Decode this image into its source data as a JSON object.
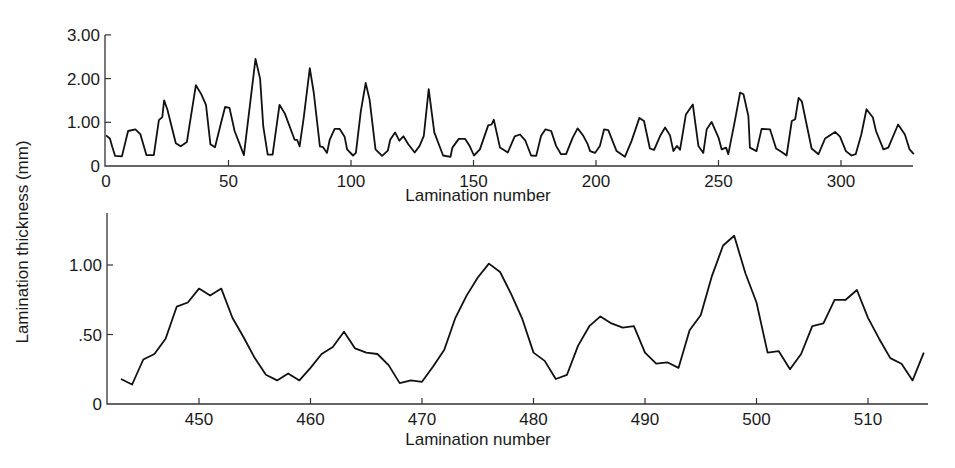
{
  "chart_data": [
    {
      "type": "line",
      "title": "",
      "xlabel": "Lamination number",
      "ylabel": "Lamination thickness (mm)",
      "xlim": [
        0,
        332
      ],
      "ylim": [
        0,
        3.0
      ],
      "grid": false,
      "legend": null,
      "x_ticks": [
        0,
        50,
        100,
        150,
        200,
        250,
        300
      ],
      "x_tick_labels": [
        "0",
        "50",
        "100",
        "150",
        "200",
        "250",
        "300"
      ],
      "y_ticks": [
        0,
        1.0,
        2.0,
        3.0
      ],
      "y_tick_labels": [
        "0",
        "1.00",
        "2.00",
        "3.00"
      ],
      "series": [
        {
          "name": "thickness",
          "points": [
            [
              0,
              0.7
            ],
            [
              1.6,
              0.63
            ],
            [
              2.5,
              0.45
            ],
            [
              3.7,
              0.23
            ],
            [
              6.5,
              0.22
            ],
            [
              9,
              0.8
            ],
            [
              12,
              0.84
            ],
            [
              14,
              0.73
            ],
            [
              16.5,
              0.25
            ],
            [
              19.5,
              0.25
            ],
            [
              21.6,
              1.05
            ],
            [
              23,
              1.12
            ],
            [
              23.7,
              1.5
            ],
            [
              25,
              1.3
            ],
            [
              28.5,
              0.52
            ],
            [
              30.5,
              0.45
            ],
            [
              33,
              0.55
            ],
            [
              34,
              0.9
            ],
            [
              36.7,
              1.85
            ],
            [
              38.8,
              1.65
            ],
            [
              40.8,
              1.4
            ],
            [
              42.6,
              0.5
            ],
            [
              44.5,
              0.43
            ],
            [
              47,
              1.0
            ],
            [
              48.6,
              1.35
            ],
            [
              50.4,
              1.33
            ],
            [
              52.5,
              0.8
            ],
            [
              56.3,
              0.25
            ],
            [
              61,
              2.45
            ],
            [
              62.9,
              2.0
            ],
            [
              64.2,
              0.9
            ],
            [
              66,
              0.26
            ],
            [
              68,
              0.26
            ],
            [
              70.8,
              1.4
            ],
            [
              73,
              1.2
            ],
            [
              77,
              0.6
            ],
            [
              78,
              0.6
            ],
            [
              79,
              0.45
            ],
            [
              80.7,
              1.1
            ],
            [
              83.2,
              2.24
            ],
            [
              84.8,
              1.67
            ],
            [
              87.3,
              0.45
            ],
            [
              88.6,
              0.43
            ],
            [
              90.2,
              0.3
            ],
            [
              91.3,
              0.6
            ],
            [
              93.3,
              0.85
            ],
            [
              95.4,
              0.85
            ],
            [
              97.4,
              0.67
            ],
            [
              98.4,
              0.38
            ],
            [
              100.8,
              0.24
            ],
            [
              102,
              0.3
            ],
            [
              104,
              1.25
            ],
            [
              106,
              1.9
            ],
            [
              107.6,
              1.52
            ],
            [
              110,
              0.38
            ],
            [
              112.7,
              0.23
            ],
            [
              115,
              0.35
            ],
            [
              116,
              0.6
            ],
            [
              118,
              0.77
            ],
            [
              119.7,
              0.58
            ],
            [
              121.4,
              0.68
            ],
            [
              123.4,
              0.5
            ],
            [
              126,
              0.31
            ],
            [
              128,
              0.46
            ],
            [
              129.7,
              0.69
            ],
            [
              131.7,
              1.76
            ],
            [
              134,
              0.77
            ],
            [
              137.6,
              0.24
            ],
            [
              140.6,
              0.21
            ],
            [
              141.4,
              0.42
            ],
            [
              144,
              0.62
            ],
            [
              146.6,
              0.62
            ],
            [
              148.5,
              0.45
            ],
            [
              150.2,
              0.24
            ],
            [
              152.6,
              0.38
            ],
            [
              156,
              0.93
            ],
            [
              157.4,
              0.95
            ],
            [
              158.3,
              1.06
            ],
            [
              160.8,
              0.42
            ],
            [
              164,
              0.31
            ],
            [
              166.8,
              0.68
            ],
            [
              169,
              0.72
            ],
            [
              171.2,
              0.58
            ],
            [
              173.5,
              0.24
            ],
            [
              175.6,
              0.23
            ],
            [
              177.6,
              0.69
            ],
            [
              179.4,
              0.84
            ],
            [
              181.7,
              0.8
            ],
            [
              183.7,
              0.46
            ],
            [
              185.7,
              0.27
            ],
            [
              187.8,
              0.27
            ],
            [
              190.5,
              0.65
            ],
            [
              192.5,
              0.86
            ],
            [
              194.8,
              0.69
            ],
            [
              196.6,
              0.5
            ],
            [
              197.6,
              0.34
            ],
            [
              199.6,
              0.3
            ],
            [
              201.6,
              0.46
            ],
            [
              203.3,
              0.84
            ],
            [
              205,
              0.82
            ],
            [
              208.4,
              0.34
            ],
            [
              211.8,
              0.21
            ],
            [
              214.5,
              0.57
            ],
            [
              217.7,
              1.1
            ],
            [
              219.6,
              1.03
            ],
            [
              222,
              0.4
            ],
            [
              223.7,
              0.37
            ],
            [
              226.2,
              0.69
            ],
            [
              228.2,
              0.88
            ],
            [
              230.2,
              0.7
            ],
            [
              231.6,
              0.34
            ],
            [
              233,
              0.46
            ],
            [
              234.3,
              0.37
            ],
            [
              236.7,
              1.18
            ],
            [
              239.5,
              1.41
            ],
            [
              241.8,
              0.46
            ],
            [
              243.8,
              0.3
            ],
            [
              245.2,
              0.84
            ],
            [
              247.2,
              1.01
            ],
            [
              250,
              0.65
            ],
            [
              251.3,
              0.38
            ],
            [
              253.1,
              0.42
            ],
            [
              254,
              0.27
            ],
            [
              256.8,
              1.07
            ],
            [
              258.8,
              1.68
            ],
            [
              260.2,
              1.64
            ],
            [
              262.2,
              1.14
            ],
            [
              262.8,
              0.42
            ],
            [
              265.5,
              0.34
            ],
            [
              267.6,
              0.85
            ],
            [
              271,
              0.84
            ],
            [
              273.5,
              0.4
            ],
            [
              275.8,
              0.32
            ],
            [
              277.8,
              0.24
            ],
            [
              279.9,
              1.03
            ],
            [
              281.3,
              1.07
            ],
            [
              282.7,
              1.56
            ],
            [
              284,
              1.48
            ],
            [
              288,
              0.4
            ],
            [
              290.8,
              0.27
            ],
            [
              293.5,
              0.63
            ],
            [
              297.6,
              0.78
            ],
            [
              299.6,
              0.67
            ],
            [
              302,
              0.34
            ],
            [
              304.3,
              0.24
            ],
            [
              306,
              0.27
            ],
            [
              308.3,
              0.72
            ],
            [
              310.4,
              1.3
            ],
            [
              313,
              1.11
            ],
            [
              314.3,
              0.8
            ],
            [
              317.3,
              0.38
            ],
            [
              319.3,
              0.42
            ],
            [
              323.3,
              0.95
            ],
            [
              326.1,
              0.72
            ],
            [
              328,
              0.38
            ],
            [
              329.7,
              0.27
            ]
          ]
        }
      ]
    },
    {
      "type": "line",
      "title": "",
      "xlabel": "Lamination number",
      "ylabel": "Lamination thickness (mm)",
      "xlim": [
        441,
        516
      ],
      "ylim": [
        0,
        1.37
      ],
      "grid": false,
      "legend": null,
      "x_ticks": [
        450,
        460,
        470,
        480,
        490,
        500,
        510
      ],
      "x_tick_labels": [
        "450",
        "460",
        "470",
        "480",
        "490",
        "500",
        "510"
      ],
      "y_ticks": [
        0,
        0.5,
        1.0
      ],
      "y_tick_labels": [
        "0",
        ".50",
        "1.00"
      ],
      "series": [
        {
          "name": "thickness",
          "x": [
            443,
            444,
            445,
            446,
            447,
            448,
            449,
            450,
            451,
            452,
            453,
            454,
            455,
            456,
            457,
            458,
            459,
            460,
            461,
            462,
            463,
            464,
            465,
            466,
            467,
            468,
            469,
            470,
            471,
            472,
            473,
            474,
            475,
            476,
            477,
            478,
            479,
            480,
            481,
            482,
            483,
            484,
            485,
            486,
            487,
            488,
            489,
            490,
            491,
            492,
            493,
            494,
            495,
            496,
            497,
            498,
            499,
            500,
            501,
            502,
            503,
            504,
            505,
            506,
            507,
            508,
            509,
            510,
            511,
            512,
            513,
            514,
            515
          ],
          "values": [
            0.18,
            0.14,
            0.32,
            0.36,
            0.47,
            0.7,
            0.73,
            0.83,
            0.78,
            0.83,
            0.62,
            0.48,
            0.33,
            0.21,
            0.17,
            0.22,
            0.17,
            0.26,
            0.36,
            0.41,
            0.52,
            0.4,
            0.37,
            0.36,
            0.28,
            0.15,
            0.17,
            0.16,
            0.27,
            0.39,
            0.62,
            0.78,
            0.91,
            1.01,
            0.95,
            0.79,
            0.61,
            0.37,
            0.31,
            0.18,
            0.21,
            0.42,
            0.56,
            0.63,
            0.58,
            0.55,
            0.56,
            0.37,
            0.29,
            0.3,
            0.26,
            0.53,
            0.64,
            0.92,
            1.14,
            1.21,
            0.94,
            0.73,
            0.37,
            0.38,
            0.25,
            0.36,
            0.56,
            0.58,
            0.75,
            0.75,
            0.82,
            0.62,
            0.47,
            0.33,
            0.29,
            0.17,
            0.37
          ]
        }
      ]
    }
  ],
  "labels": {
    "y_axis_shared": "Lamination thickness (mm)",
    "top_x_axis": "Lamination number",
    "bottom_x_axis": "Lamination number"
  },
  "layout": {
    "top": {
      "x0px": 106,
      "pxPerX": 2.45,
      "xmin": 0,
      "y0px": 166,
      "pxPerY": 43.7,
      "axisLeft": 105,
      "axisTop": 35,
      "axisRight": 913,
      "tickLen": 6
    },
    "bottom": {
      "x0px": 199,
      "pxPerX": 11.15,
      "xmin": 450,
      "y0px": 404,
      "pxPerY": 139,
      "axisLeft": 107,
      "axisTop": 213,
      "axisRight": 928,
      "tickLen": 6
    },
    "line_color": "#111111"
  }
}
